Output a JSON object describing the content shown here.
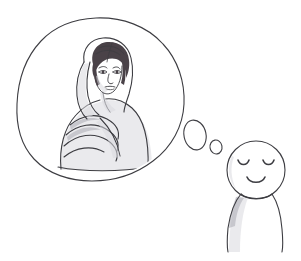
{
  "scene": {
    "title": "Thought bubble sketch",
    "description": "Hand-drawn pencil sketch: a simple smiling cartoon figure imagines a woman wearing a headscarf inside a large thought bubble.",
    "width": 301,
    "height": 261,
    "background_color": "#ffffff",
    "ink_color": "#3d3d42",
    "style": "pencil line drawing"
  },
  "thought_bubble": {
    "name": "large thought cloud",
    "shape": "irregular rounded blob",
    "center_x": 101,
    "center_y": 100,
    "radius_x": 84,
    "radius_y": 82,
    "stroke_color": "#3d3d42",
    "fill_color": "#ffffff"
  },
  "bubble_trail": {
    "name": "thought bubble trail",
    "bubbles": [
      {
        "label": "trail-bubble-large",
        "cx": 195,
        "cy": 135,
        "rx": 11,
        "ry": 15,
        "rotation": -12
      },
      {
        "label": "trail-bubble-small",
        "cx": 216,
        "cy": 147,
        "rx": 6,
        "ry": 7,
        "rotation": -10
      }
    ]
  },
  "thinker": {
    "name": "cartoon figure",
    "head": {
      "cx": 256,
      "cy": 170,
      "r": 29
    },
    "expression": "content, eyes closed, gentle smile",
    "eyes": [
      {
        "label": "left-eye",
        "cx": 243,
        "cy": 163,
        "style": "closed arc"
      },
      {
        "label": "right-eye",
        "cx": 268,
        "cy": 163,
        "style": "closed arc"
      }
    ],
    "mouth": {
      "label": "smile",
      "cx": 256,
      "cy": 179,
      "style": "upward arc"
    },
    "body": {
      "label": "tapered torso",
      "top_y": 196,
      "bottom_y": 252,
      "left_x": 228,
      "right_x": 282
    },
    "shading_color": "#a9a9b2"
  },
  "portrait": {
    "name": "woman in headscarf portrait",
    "subject": "young woman wearing a headscarf and draped shawl",
    "hair": {
      "color": "#4a4248",
      "description": "dark hair with side part, fringe swept across forehead"
    },
    "headscarf": {
      "color": "#ffffff",
      "description": "light headscarf framing the face and draping over the shoulders"
    },
    "shawl": {
      "description": "layered shawl folds falling across the chest and left shoulder"
    },
    "pose": "three-quarter view, head turned slightly to viewer's right",
    "bounds": {
      "x": 52,
      "y": 38,
      "width": 100,
      "height": 130
    }
  }
}
